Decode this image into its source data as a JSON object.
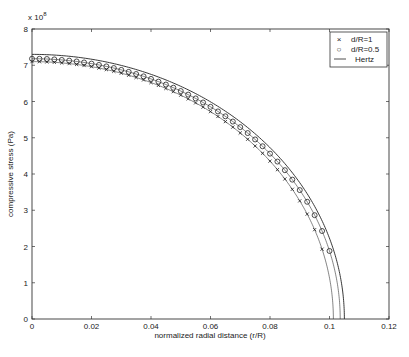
{
  "chart_data": {
    "type": "line",
    "title": "",
    "xlabel": "normalized radial distance (r/R)",
    "ylabel": "compressive stress (Pa)",
    "y_multiplier": "x 10^8",
    "xlim": [
      0,
      0.12
    ],
    "ylim": [
      0,
      8
    ],
    "xticks": [
      0,
      0.02,
      0.04,
      0.06,
      0.08,
      0.1,
      0.12
    ],
    "xtick_labels": [
      "0",
      "0.02",
      "0.04",
      "0.06",
      "0.08",
      "0.1",
      "0.12"
    ],
    "yticks": [
      0,
      1,
      2,
      3,
      4,
      5,
      6,
      7,
      8
    ],
    "ytick_labels": [
      "0",
      "1",
      "2",
      "3",
      "4",
      "5",
      "6",
      "7",
      "8"
    ],
    "grid": false,
    "legend_position": "upper right",
    "series": [
      {
        "name": "d/R=1",
        "marker": "x",
        "line": "none",
        "contact_radius": 0.1013,
        "peak": 7.1
      },
      {
        "name": "d/R=0.5",
        "marker": "o",
        "line": "none",
        "contact_radius": 0.1036,
        "peak": 7.18
      },
      {
        "name": "Hertz",
        "marker": "none",
        "line": "solid",
        "contact_radius": 0.105,
        "peak": 7.3
      }
    ],
    "curve_form": "p(r) = peak * sqrt(1 - (r/a)^2)"
  },
  "legend": {
    "items": [
      {
        "symbol": "×",
        "label": "d/R=1"
      },
      {
        "symbol": "○",
        "label": "d/R=0.5"
      },
      {
        "symbol": "—",
        "label": "Hertz"
      }
    ]
  },
  "labels": {
    "x": "normalized radial distance (r/R)",
    "y": "compressive stress (Pa)",
    "exponent_base": "x 10",
    "exponent_power": "8"
  }
}
